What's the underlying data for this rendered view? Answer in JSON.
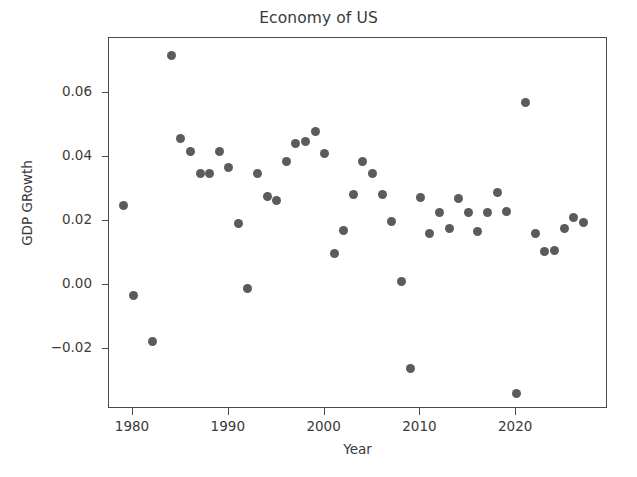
{
  "chart_data": {
    "type": "scatter",
    "title": "Economy of US",
    "xlabel": "Year",
    "ylabel": "GDP GRowth",
    "grid": false,
    "legend": null,
    "marker_color": "#5b5b5b",
    "frame_color": "#4a4a4a",
    "xlim": [
      1977.6,
      1029.0
    ],
    "ylim": [
      -0.0383,
      0.0772
    ],
    "xticks": [
      1980,
      1990,
      2000,
      2010,
      2020
    ],
    "xticklabels": [
      "1980",
      "1990",
      "2000",
      "2010",
      "2020"
    ],
    "yticks": [
      -0.02,
      0.0,
      0.02,
      0.04,
      0.06
    ],
    "yticklabels": [
      "−0.02",
      "0.00",
      "0.02",
      "0.04",
      "0.06"
    ],
    "x": [
      1979,
      1980,
      1982,
      1984,
      1985,
      1986,
      1987,
      1988,
      1989,
      1990,
      1991,
      1992,
      1993,
      1994,
      1995,
      1996,
      1997,
      1998,
      1999,
      2000,
      2001,
      2002,
      2003,
      2004,
      2005,
      2006,
      2007,
      2008,
      2009,
      2010,
      2011,
      2012,
      2013,
      2014,
      2015,
      2016,
      2017,
      2018,
      2019,
      2020,
      2021,
      2022,
      2023,
      2024,
      2025,
      2026,
      2027
    ],
    "y": [
      0.0247,
      -0.0032,
      -0.0178,
      0.0717,
      0.0459,
      0.0417,
      0.0348,
      0.0348,
      0.0417,
      0.0368,
      0.0193,
      -0.0012,
      0.035,
      0.0277,
      0.0264,
      0.0386,
      0.0441,
      0.0448,
      0.0479,
      0.041,
      0.01,
      0.017,
      0.0283,
      0.0387,
      0.035,
      0.0283,
      0.02,
      0.001,
      -0.0262,
      0.0273,
      0.016,
      0.0228,
      0.0178,
      0.027,
      0.0228,
      0.0167,
      0.0228,
      0.029,
      0.023,
      -0.034,
      0.057,
      0.016,
      0.0105,
      0.0108,
      0.0177,
      0.0212,
      0.0196
    ]
  },
  "axes": {
    "x_pixel_map": {
      "ref_value": 1980,
      "ref_px": 132,
      "px_per_unit": 9.58
    },
    "y_pixel_map": {
      "ref_value": 0.06,
      "ref_px": 92,
      "px_per_unit": -3200
    }
  }
}
